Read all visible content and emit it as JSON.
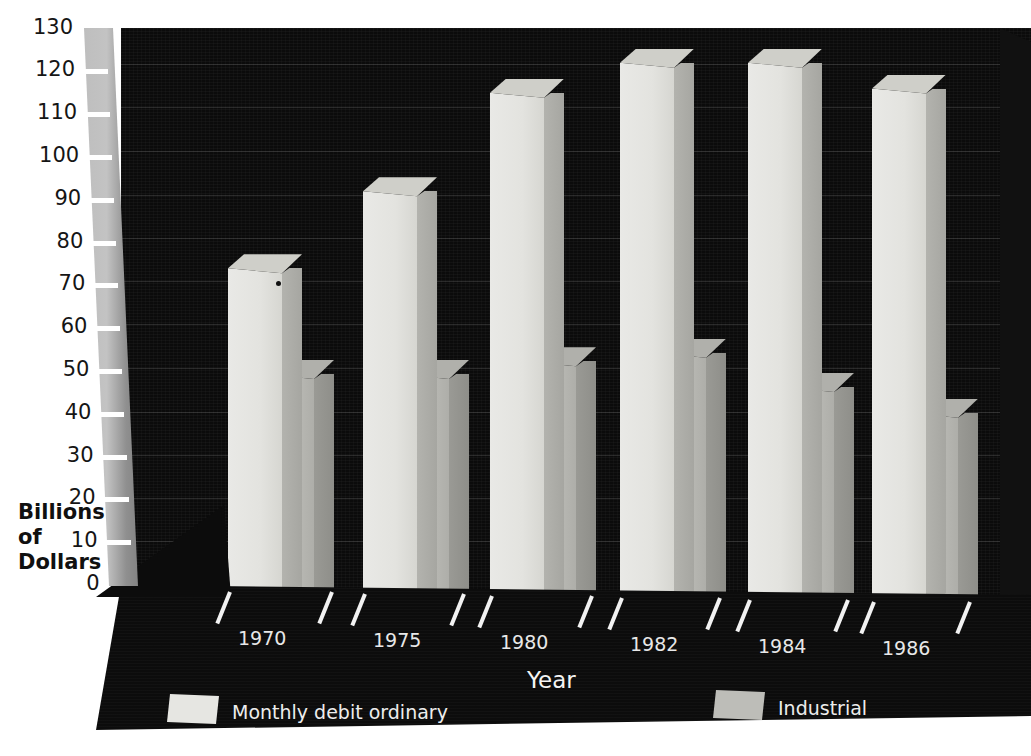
{
  "chart_data": {
    "type": "bar",
    "render_style": "3d-grouped-bar",
    "title": "",
    "xlabel": "Year",
    "ylabel": "Billions of Dollars",
    "ylabel_lines": [
      "Billions",
      "of",
      "Dollars"
    ],
    "categories": [
      "1970",
      "1975",
      "1980",
      "1982",
      "1984",
      "1986"
    ],
    "ylim": [
      0,
      130
    ],
    "ytick_step": 10,
    "yticks": [
      0,
      10,
      20,
      30,
      40,
      50,
      60,
      70,
      80,
      90,
      100,
      110,
      120,
      130
    ],
    "ytick_labels": [
      "0",
      "10",
      "20",
      "30",
      "40",
      "50",
      "60",
      "70",
      "80",
      "90",
      "100",
      "110",
      "120",
      "130"
    ],
    "grid": true,
    "legend_position": "bottom",
    "series": [
      {
        "name": "Monthly debit ordinary",
        "color": "#e6e6e2",
        "values": [
          74,
          92,
          115,
          122,
          122,
          116
        ]
      },
      {
        "name": "Industrial",
        "color": "#bdbdb8",
        "values": [
          46,
          46,
          49,
          51,
          43,
          37
        ]
      }
    ]
  },
  "axes": {
    "y_title_lines": [
      "Billions",
      "of",
      "Dollars"
    ],
    "x_title": "Year"
  },
  "legend": {
    "items": [
      {
        "label": "Monthly debit ordinary",
        "swatch": "#e6e6e2"
      },
      {
        "label": "Industrial",
        "swatch": "#bdbdb8"
      }
    ]
  },
  "colors": {
    "plot_background": "#0b0b0b",
    "page_background": "#ffffff",
    "axis_ribbon": "#c3c3c3",
    "series_ordinary": "#e6e6e2",
    "series_industrial": "#bdbdb8",
    "tick": "#ffffff",
    "text_light": "#ededed",
    "text_dark": "#151515"
  }
}
